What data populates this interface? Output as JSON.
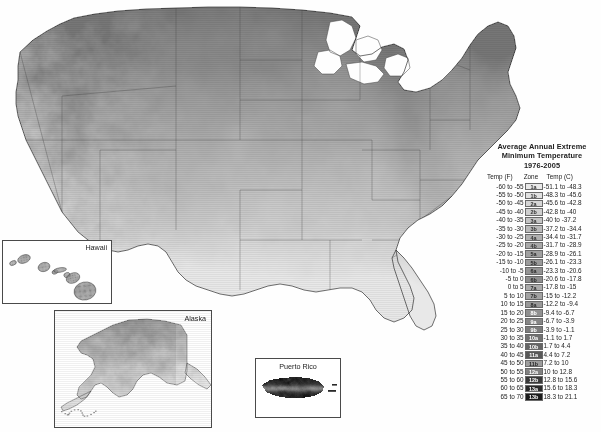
{
  "map": {
    "name": "usda-plant-hardiness-zone-map",
    "title_lines": [
      "Average Annual Extreme",
      "Minimum Temperature",
      "1976-2005"
    ],
    "background_color": "#ffffff",
    "border_color": "#4a4a4a"
  },
  "legend": {
    "headers": {
      "temp_f": "Temp (F)",
      "zone": "Zone",
      "temp_c": "Temp (C)"
    },
    "rows": [
      {
        "temp_f": "-60 to -55",
        "zone": "1a",
        "temp_c": "-51.1 to -48.3",
        "color": "#e9e9e9",
        "text_color": "#333333"
      },
      {
        "temp_f": "-55 to -50",
        "zone": "1b",
        "temp_c": "-48.3 to -45.6",
        "color": "#e2e2e2",
        "text_color": "#333333"
      },
      {
        "temp_f": "-50 to -45",
        "zone": "2a",
        "temp_c": "-45.6 to -42.8",
        "color": "#d6d6d6",
        "text_color": "#333333"
      },
      {
        "temp_f": "-45 to -40",
        "zone": "2b",
        "temp_c": "-42.8 to -40",
        "color": "#cfcfcf",
        "text_color": "#333333"
      },
      {
        "temp_f": "-40 to -35",
        "zone": "3a",
        "temp_c": "-40 to -37.2",
        "color": "#c4c4c4",
        "text_color": "#333333"
      },
      {
        "temp_f": "-35 to -30",
        "zone": "3b",
        "temp_c": "-37.2 to -34.4",
        "color": "#bababa",
        "text_color": "#333333"
      },
      {
        "temp_f": "-30 to -25",
        "zone": "4a",
        "temp_c": "-34.4 to -31.7",
        "color": "#b0b0b0",
        "text_color": "#333333"
      },
      {
        "temp_f": "-25 to -20",
        "zone": "4b",
        "temp_c": "-31.7 to -28.9",
        "color": "#a8a8a8",
        "text_color": "#333333"
      },
      {
        "temp_f": "-20 to -15",
        "zone": "5a",
        "temp_c": "-28.9 to -26.1",
        "color": "#a0a0a0",
        "text_color": "#2a2a2a"
      },
      {
        "temp_f": "-15 to -10",
        "zone": "5b",
        "temp_c": "-26.1 to -23.3",
        "color": "#9a9a9a",
        "text_color": "#2a2a2a"
      },
      {
        "temp_f": "-10 to -5",
        "zone": "6a",
        "temp_c": "-23.3 to -20.6",
        "color": "#949494",
        "text_color": "#2a2a2a"
      },
      {
        "temp_f": "-5 to 0",
        "zone": "6b",
        "temp_c": "-20.6 to -17.8",
        "color": "#8e8e8e",
        "text_color": "#2a2a2a"
      },
      {
        "temp_f": "0 to 5",
        "zone": "7a",
        "temp_c": "-17.8 to -15",
        "color": "#ababab",
        "text_color": "#2a2a2a"
      },
      {
        "temp_f": "5 to 10",
        "zone": "7b",
        "temp_c": "-15 to -12.2",
        "color": "#a2a2a2",
        "text_color": "#2a2a2a"
      },
      {
        "temp_f": "10 to 15",
        "zone": "8a",
        "temp_c": "-12.2 to -9.4",
        "color": "#999999",
        "text_color": "#2a2a2a"
      },
      {
        "temp_f": "15 to 20",
        "zone": "8b",
        "temp_c": "-9.4 to -6.7",
        "color": "#909090",
        "text_color": "#ffffff"
      },
      {
        "temp_f": "20 to 25",
        "zone": "9a",
        "temp_c": "-6.7 to -3.9",
        "color": "#868686",
        "text_color": "#ffffff"
      },
      {
        "temp_f": "25 to 30",
        "zone": "9b",
        "temp_c": "-3.9 to -1.1",
        "color": "#7c7c7c",
        "text_color": "#ffffff"
      },
      {
        "temp_f": "30 to 35",
        "zone": "10a",
        "temp_c": "-1.1 to 1.7",
        "color": "#717171",
        "text_color": "#ffffff"
      },
      {
        "temp_f": "35 to 40",
        "zone": "10b",
        "temp_c": "1.7 to 4.4",
        "color": "#656565",
        "text_color": "#ffffff"
      },
      {
        "temp_f": "40 to 45",
        "zone": "11a",
        "temp_c": "4.4 to 7.2",
        "color": "#585858",
        "text_color": "#ffffff"
      },
      {
        "temp_f": "45 to 50",
        "zone": "11b",
        "temp_c": "7.2 to 10",
        "color": "#9d9d9d",
        "text_color": "#2a2a2a"
      },
      {
        "temp_f": "50 to 55",
        "zone": "12a",
        "temp_c": "10 to 12.8",
        "color": "#828282",
        "text_color": "#ffffff"
      },
      {
        "temp_f": "55 to 60",
        "zone": "12b",
        "temp_c": "12.8 to 15.6",
        "color": "#3a3a3a",
        "text_color": "#ffffff"
      },
      {
        "temp_f": "60 to 65",
        "zone": "13a",
        "temp_c": "15.6 to 18.3",
        "color": "#2a2a2a",
        "text_color": "#ffffff"
      },
      {
        "temp_f": "65 to 70",
        "zone": "13b",
        "temp_c": "18.3 to 21.1",
        "color": "#1c1c1c",
        "text_color": "#ffffff"
      }
    ]
  },
  "insets": [
    {
      "id": "hawaii",
      "label": "Hawaii"
    },
    {
      "id": "alaska",
      "label": "Alaska"
    },
    {
      "id": "puerto-rico",
      "label": "Puerto Rico"
    }
  ]
}
